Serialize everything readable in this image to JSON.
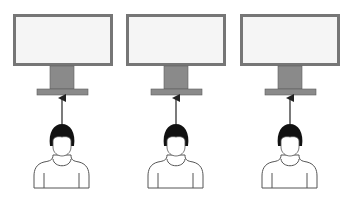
{
  "diagram": {
    "title": "",
    "units": [
      {
        "monitor": "monitor",
        "user": "person",
        "relation": "looks-at"
      },
      {
        "monitor": "monitor",
        "user": "person",
        "relation": "looks-at"
      },
      {
        "monitor": "monitor",
        "user": "person",
        "relation": "looks-at"
      }
    ],
    "colors": {
      "frame": "#767676",
      "screen": "#f5f5f5",
      "stand": "#8a8a8a",
      "stand_outline": "#5e5e5e",
      "hair": "#111111",
      "outline": "#555555",
      "arrow": "#222222",
      "body_fill": "#ffffff"
    }
  }
}
